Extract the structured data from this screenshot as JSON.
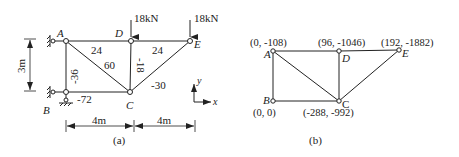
{
  "figure_a": {
    "caption": "(a)",
    "nodes": {
      "A": {
        "label": "A",
        "x": 66,
        "y": 41
      },
      "D": {
        "label": "D",
        "x": 131,
        "y": 41
      },
      "E": {
        "label": "E",
        "x": 190,
        "y": 41
      },
      "B": {
        "label": "B",
        "x": 66,
        "y": 92
      },
      "C": {
        "label": "C",
        "x": 130,
        "y": 92
      }
    },
    "members": [
      {
        "from": "A",
        "to": "D",
        "force": "24"
      },
      {
        "from": "D",
        "to": "E",
        "force": "24"
      },
      {
        "from": "A",
        "to": "C",
        "force": "60"
      },
      {
        "from": "D",
        "to": "C",
        "force": "-18"
      },
      {
        "from": "E",
        "to": "C",
        "force": "-30"
      },
      {
        "from": "A",
        "to": "B",
        "force": "-36"
      },
      {
        "from": "B",
        "to": "C",
        "force": "-72"
      }
    ],
    "loads": [
      {
        "node": "D",
        "label": "18kN"
      },
      {
        "node": "E",
        "label": "18kN"
      }
    ],
    "dimensions": {
      "height": "3m",
      "span1": "4m",
      "span2": "4m"
    },
    "axes": {
      "x": "x",
      "y": "y"
    }
  },
  "figure_b": {
    "caption": "(b)",
    "nodes": {
      "A": {
        "label": "A",
        "coord": "(0, -108)"
      },
      "D": {
        "label": "D",
        "coord": "(96, -1046)"
      },
      "E": {
        "label": "E",
        "coord": "(192, -1882)"
      },
      "B": {
        "label": "B",
        "coord": "(0, 0)"
      },
      "C": {
        "label": "C",
        "coord": "(-288, -992)"
      }
    }
  }
}
